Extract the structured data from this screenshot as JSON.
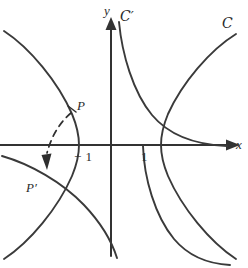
{
  "figure": {
    "axes": {
      "x_label": "x",
      "y_label": "y",
      "origin_px": [
        111,
        145
      ],
      "x_ticks": [
        {
          "value": -1,
          "label": "− 1",
          "x_px": 79
        },
        {
          "value": 1,
          "label": "1",
          "x_px": 143
        }
      ],
      "line_color": "#333333"
    },
    "points": [
      {
        "name": "P",
        "label": "P",
        "x_px": 73,
        "y_px": 112
      },
      {
        "name": "P'",
        "label": "P′",
        "x_px": 45,
        "y_px": 172
      }
    ],
    "curves": [
      {
        "name": "C",
        "label": "C",
        "script": true,
        "prime": false,
        "description": "hyperbola branches opening left and right, vertices at x = -1 and x = 1"
      },
      {
        "name": "C'",
        "label": "C",
        "script": true,
        "prime": true,
        "description": "image hyperbola, rectangular, asymptotic to the axes"
      }
    ],
    "annotation": {
      "kind": "dashed-arc-with-arrow",
      "from": "P",
      "to": "P'",
      "description": "dashed arc with arrowhead indicating the inversion map sending P to P'"
    },
    "colors": {
      "ink": "#2b2b2b",
      "curve": "#3a3a3a",
      "axis": "#333333",
      "dash": "#2f2f2f",
      "background": "#ffffff"
    }
  }
}
